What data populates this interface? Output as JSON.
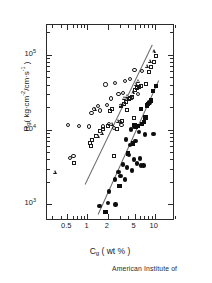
{
  "figure": {
    "caption": "American Institute of"
  },
  "chart_data": {
    "type": "scatter",
    "title": "",
    "xlabel": "Cg ( wt % )",
    "ylabel": "Rg ( kg·cm⁻²/cm·s⁻¹ )",
    "xscale": "log",
    "yscale": "log",
    "xlim": [
      0.25,
      20
    ],
    "ylim": [
      600,
      250000
    ],
    "grid": false,
    "legend": "none",
    "x_axis": {
      "label_main": "C",
      "label_sub": "g",
      "label_unit": "( wt % )",
      "tick_labels": [
        "0.5",
        "1",
        "2",
        "5",
        "10"
      ],
      "tick_values": [
        0.5,
        1,
        2,
        5,
        10
      ]
    },
    "y_axis": {
      "label_main": "R",
      "label_sub": "g",
      "label_unit_open": "(  kg·cm",
      "label_unit_exp1": "-2",
      "label_unit_mid": "/cm·s",
      "label_unit_exp2": "-1",
      "label_unit_close": " )",
      "tick_labels": [
        "10",
        "10",
        "10"
      ],
      "tick_exponents": [
        "5",
        "4",
        "3"
      ],
      "tick_values": [
        100000,
        10000,
        1000
      ]
    },
    "series": [
      {
        "name": "open-circles",
        "marker": "circle-open",
        "points": [
          [
            0.62,
            4400
          ],
          [
            0.55,
            4200
          ],
          [
            0.52,
            11500
          ],
          [
            0.75,
            11300
          ],
          [
            1.05,
            11000
          ],
          [
            1.25,
            19000
          ],
          [
            1.15,
            16500
          ],
          [
            1.45,
            20500
          ],
          [
            1.55,
            18000
          ],
          [
            1.95,
            21500
          ],
          [
            1.85,
            40000
          ],
          [
            2.6,
            42000
          ],
          [
            2.25,
            26000
          ],
          [
            2.1,
            12000
          ],
          [
            1.7,
            11000
          ],
          [
            2.9,
            30000
          ],
          [
            3.4,
            31000
          ],
          [
            3.05,
            12500
          ],
          [
            3.6,
            45000
          ],
          [
            4.3,
            47000
          ],
          [
            5.0,
            62000
          ],
          [
            5.6,
            30000
          ],
          [
            4.6,
            26500
          ],
          [
            6.5,
            60000
          ],
          [
            3.2,
            11500
          ],
          [
            2.45,
            10500
          ]
        ]
      },
      {
        "name": "open-squares",
        "marker": "square-open",
        "points": [
          [
            0.63,
            3600
          ],
          [
            1.1,
            6600
          ],
          [
            1.12,
            6100
          ],
          [
            1.18,
            7300
          ],
          [
            1.35,
            8100
          ],
          [
            1.55,
            9700
          ],
          [
            1.7,
            10200
          ],
          [
            2.0,
            11200
          ],
          [
            2.15,
            17500
          ],
          [
            2.3,
            19000
          ],
          [
            2.5,
            4500
          ],
          [
            2.75,
            10200
          ],
          [
            3.1,
            20500
          ],
          [
            3.5,
            22000
          ],
          [
            3.7,
            23500
          ],
          [
            3.85,
            18500
          ],
          [
            4.1,
            25500
          ],
          [
            4.35,
            26500
          ],
          [
            4.6,
            27500
          ],
          [
            5.1,
            34000
          ],
          [
            5.4,
            36000
          ],
          [
            5.9,
            37000
          ],
          [
            6.3,
            38500
          ],
          [
            7.3,
            41000
          ],
          [
            8.1,
            58000
          ],
          [
            8.8,
            68000
          ],
          [
            9.6,
            80000
          ],
          [
            10.5,
            97000
          ],
          [
            4.9,
            14500
          ],
          [
            3.3,
            13000
          ]
        ]
      },
      {
        "name": "open-triangles",
        "marker": "triangle-open",
        "points": [
          [
            0.33,
            2700
          ],
          [
            1.45,
            8200
          ],
          [
            1.65,
            9000
          ],
          [
            1.3,
            18500
          ],
          [
            2.35,
            11800
          ],
          [
            2.85,
            13000
          ],
          [
            3.15,
            21000
          ],
          [
            3.6,
            26000
          ],
          [
            4.0,
            28000
          ],
          [
            4.8,
            31000
          ],
          [
            5.3,
            40000
          ],
          [
            5.8,
            44000
          ],
          [
            7.8,
            70000
          ],
          [
            8.6,
            82000
          ],
          [
            9.8,
            110000
          ]
        ]
      },
      {
        "name": "filled-circles",
        "marker": "circle-filled",
        "points": [
          [
            1.5,
            960
          ],
          [
            2.0,
            1050
          ],
          [
            2.1,
            1480
          ],
          [
            2.6,
            1000
          ],
          [
            2.55,
            2150
          ],
          [
            2.9,
            2700
          ],
          [
            3.1,
            2400
          ],
          [
            3.35,
            3400
          ],
          [
            3.6,
            2150
          ],
          [
            3.9,
            3100
          ],
          [
            4.1,
            4600
          ],
          [
            4.3,
            6200
          ],
          [
            4.6,
            2850
          ],
          [
            4.9,
            4000
          ],
          [
            5.2,
            7100
          ],
          [
            5.4,
            3500
          ],
          [
            5.8,
            9300
          ],
          [
            6.0,
            4100
          ],
          [
            6.3,
            3300
          ],
          [
            6.8,
            3300
          ],
          [
            7.2,
            8600
          ],
          [
            4.4,
            10000
          ],
          [
            5.0,
            11000
          ],
          [
            3.7,
            7400
          ],
          [
            8.3,
            23000
          ],
          [
            9.6,
            8800
          ]
        ]
      },
      {
        "name": "filled-squares",
        "marker": "square-filled",
        "points": [
          [
            1.85,
            790
          ],
          [
            3.0,
            1750
          ],
          [
            4.0,
            4800
          ],
          [
            4.7,
            6500
          ],
          [
            5.0,
            11500
          ],
          [
            5.3,
            10800
          ],
          [
            5.6,
            11200
          ],
          [
            6.4,
            11800
          ],
          [
            6.9,
            12500
          ],
          [
            7.3,
            14500
          ],
          [
            7.6,
            21000
          ],
          [
            7.9,
            22000
          ],
          [
            8.2,
            22500
          ],
          [
            8.8,
            24500
          ],
          [
            9.4,
            33000
          ],
          [
            10.3,
            38000
          ],
          [
            6.2,
            19000
          ]
        ]
      }
    ],
    "trend_lines": [
      {
        "name": "upper-fit",
        "x1": 0.93,
        "y1": 1900,
        "x2": 9.3,
        "y2": 140000
      },
      {
        "name": "lower-fit",
        "x1": 1.45,
        "y1": 740,
        "x2": 11.6,
        "y2": 46000
      }
    ]
  }
}
